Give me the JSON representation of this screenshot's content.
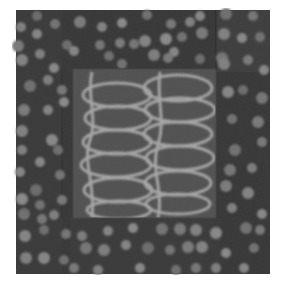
{
  "image": {
    "subject": "Art quilt photograph: dark grey dotted border surrounding a central panel with pale looping line pattern",
    "caption": "",
    "colors": {
      "page_background": "#ffffff",
      "border_fabric": "#3b3b3b",
      "border_fabric_alt": "#424242",
      "dot": "#7a7a7a",
      "center_panel": "#555555",
      "loop_line": "#a9a9a9",
      "seam": "#2e2e2e"
    }
  },
  "quilt": {
    "x": 16,
    "y": 10,
    "w": 254,
    "h": 264
  },
  "center_panel": {
    "x": 73,
    "y": 69,
    "w": 143,
    "h": 149
  },
  "border_dots": [
    [
      37,
      16,
      5
    ],
    [
      55,
      24,
      5
    ],
    [
      80,
      22,
      6
    ],
    [
      102,
      27,
      5
    ],
    [
      122,
      23,
      5
    ],
    [
      147,
      15,
      5
    ],
    [
      171,
      24,
      5
    ],
    [
      190,
      22,
      5
    ],
    [
      200,
      16,
      5
    ],
    [
      226,
      14,
      6
    ],
    [
      253,
      16,
      5
    ],
    [
      21,
      27,
      5
    ],
    [
      37,
      34,
      5
    ],
    [
      67,
      45,
      5
    ],
    [
      100,
      45,
      5
    ],
    [
      120,
      43,
      5
    ],
    [
      145,
      41,
      6
    ],
    [
      166,
      39,
      6
    ],
    [
      182,
      37,
      5
    ],
    [
      202,
      33,
      6
    ],
    [
      224,
      34,
      6
    ],
    [
      242,
      38,
      5
    ],
    [
      260,
      37,
      5
    ],
    [
      18,
      46,
      6
    ],
    [
      40,
      54,
      5
    ],
    [
      74,
      51,
      5
    ],
    [
      109,
      56,
      5
    ],
    [
      134,
      44,
      5
    ],
    [
      154,
      55,
      6
    ],
    [
      174,
      52,
      5
    ],
    [
      200,
      59,
      5
    ],
    [
      222,
      58,
      6
    ],
    [
      248,
      60,
      5
    ],
    [
      22,
      60,
      6
    ],
    [
      54,
      68,
      5
    ],
    [
      122,
      64,
      5
    ],
    [
      168,
      58,
      5
    ],
    [
      224,
      64,
      6
    ],
    [
      264,
      70,
      5
    ],
    [
      30,
      86,
      6
    ],
    [
      62,
      90,
      5
    ],
    [
      48,
      80,
      5
    ],
    [
      228,
      92,
      6
    ],
    [
      243,
      90,
      5
    ],
    [
      262,
      98,
      6
    ],
    [
      24,
      110,
      6
    ],
    [
      48,
      110,
      5
    ],
    [
      64,
      102,
      5
    ],
    [
      232,
      119,
      5
    ],
    [
      258,
      122,
      6
    ],
    [
      22,
      131,
      6
    ],
    [
      52,
      140,
      6
    ],
    [
      235,
      150,
      6
    ],
    [
      262,
      142,
      5
    ],
    [
      22,
      150,
      5
    ],
    [
      40,
      162,
      5
    ],
    [
      58,
      150,
      5
    ],
    [
      230,
      170,
      6
    ],
    [
      252,
      168,
      5
    ],
    [
      20,
      172,
      5
    ],
    [
      36,
      190,
      6
    ],
    [
      60,
      175,
      5
    ],
    [
      226,
      186,
      6
    ],
    [
      248,
      193,
      6
    ],
    [
      22,
      199,
      6
    ],
    [
      40,
      205,
      5
    ],
    [
      62,
      200,
      5
    ],
    [
      232,
      208,
      5
    ],
    [
      262,
      214,
      5
    ],
    [
      24,
      214,
      6
    ],
    [
      42,
      219,
      5
    ],
    [
      54,
      215,
      5
    ],
    [
      25,
      236,
      6
    ],
    [
      44,
      230,
      5
    ],
    [
      66,
      234,
      5
    ],
    [
      82,
      236,
      5
    ],
    [
      108,
      231,
      5
    ],
    [
      133,
      228,
      5
    ],
    [
      162,
      229,
      6
    ],
    [
      180,
      229,
      6
    ],
    [
      196,
      230,
      6
    ],
    [
      216,
      233,
      6
    ],
    [
      246,
      228,
      6
    ],
    [
      260,
      230,
      5
    ],
    [
      26,
      258,
      6
    ],
    [
      44,
      258,
      6
    ],
    [
      64,
      260,
      5
    ],
    [
      86,
      248,
      6
    ],
    [
      104,
      250,
      6
    ],
    [
      126,
      245,
      5
    ],
    [
      148,
      248,
      6
    ],
    [
      170,
      250,
      5
    ],
    [
      188,
      247,
      6
    ],
    [
      202,
      247,
      6
    ],
    [
      226,
      253,
      5
    ],
    [
      254,
      248,
      5
    ],
    [
      74,
      268,
      5
    ],
    [
      98,
      270,
      5
    ],
    [
      140,
      268,
      5
    ],
    [
      176,
      270,
      5
    ],
    [
      196,
      268,
      5
    ],
    [
      216,
      268,
      5
    ],
    [
      244,
      268,
      5
    ]
  ],
  "loops_left": [
    {
      "cx": 117,
      "cy": 95,
      "rx": 34,
      "ry": 12
    },
    {
      "cx": 118,
      "cy": 118,
      "rx": 33,
      "ry": 12
    },
    {
      "cx": 117,
      "cy": 142,
      "rx": 34,
      "ry": 12
    },
    {
      "cx": 116,
      "cy": 165,
      "rx": 35,
      "ry": 12
    },
    {
      "cx": 118,
      "cy": 190,
      "rx": 34,
      "ry": 12
    },
    {
      "cx": 119,
      "cy": 210,
      "rx": 32,
      "ry": 9
    }
  ],
  "loops_right": [
    {
      "cx": 178,
      "cy": 88,
      "rx": 34,
      "ry": 13
    },
    {
      "cx": 180,
      "cy": 110,
      "rx": 35,
      "ry": 12
    },
    {
      "cx": 178,
      "cy": 134,
      "rx": 34,
      "ry": 12
    },
    {
      "cx": 180,
      "cy": 158,
      "rx": 34,
      "ry": 12
    },
    {
      "cx": 178,
      "cy": 183,
      "rx": 33,
      "ry": 12
    },
    {
      "cx": 178,
      "cy": 204,
      "rx": 32,
      "ry": 10
    }
  ]
}
